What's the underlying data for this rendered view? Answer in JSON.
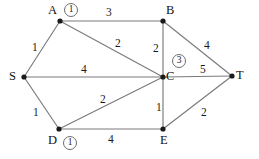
{
  "figure": {
    "type": "weighted-undirected-graph",
    "background_color": "#ffffff",
    "edge_color": "#7a7a7a",
    "node_color": "#1a1a1a",
    "annotation_border_color": "#6e6e6e"
  },
  "nodes": [
    {
      "id": "S",
      "label": "S",
      "x": 24,
      "y": 77,
      "label_x": 9,
      "label_y": 70,
      "annotation": null
    },
    {
      "id": "A",
      "label": "A",
      "x": 60,
      "y": 21,
      "label_x": 48,
      "label_y": 4,
      "annotation": "1"
    },
    {
      "id": "B",
      "label": "B",
      "x": 163,
      "y": 21,
      "label_x": 166,
      "label_y": 4,
      "annotation": null
    },
    {
      "id": "C",
      "label": "C",
      "x": 163,
      "y": 77,
      "label_x": 166,
      "label_y": 70,
      "annotation": "3"
    },
    {
      "id": "D",
      "label": "D",
      "x": 59,
      "y": 129,
      "label_x": 48,
      "label_y": 134,
      "annotation": "1"
    },
    {
      "id": "E",
      "label": "E",
      "x": 163,
      "y": 129,
      "label_x": 160,
      "label_y": 134,
      "annotation": null
    },
    {
      "id": "T",
      "label": "T",
      "x": 232,
      "y": 76,
      "label_x": 236,
      "label_y": 69,
      "annotation": null
    }
  ],
  "node_annotations": [
    {
      "node": "A",
      "value": "1",
      "x": 64,
      "y": 3
    },
    {
      "node": "C",
      "value": "3",
      "x": 172,
      "y": 54
    },
    {
      "node": "D",
      "value": "1",
      "x": 63,
      "y": 136
    }
  ],
  "edges": [
    {
      "id": "S-A",
      "from": "S",
      "to": "A",
      "weight": "1",
      "label_x": 32,
      "label_y": 42
    },
    {
      "id": "S-C",
      "from": "S",
      "to": "C",
      "weight": "4",
      "label_x": 81,
      "label_y": 64
    },
    {
      "id": "S-D",
      "from": "S",
      "to": "D",
      "weight": "1",
      "label_x": 33,
      "label_y": 107
    },
    {
      "id": "A-B",
      "from": "A",
      "to": "B",
      "weight": "3",
      "label_x": 106,
      "label_y": 7
    },
    {
      "id": "A-C",
      "from": "A",
      "to": "C",
      "weight": "2",
      "label_x": 115,
      "label_y": 38
    },
    {
      "id": "B-C",
      "from": "B",
      "to": "C",
      "weight": "2",
      "label_x": 153,
      "label_y": 43
    },
    {
      "id": "B-T",
      "from": "B",
      "to": "T",
      "weight": "4",
      "label_x": 204,
      "label_y": 40
    },
    {
      "id": "C-T",
      "from": "C",
      "to": "T",
      "weight": "5",
      "label_x": 200,
      "label_y": 64
    },
    {
      "id": "C-D",
      "from": "C",
      "to": "D",
      "weight": "2",
      "label_x": 100,
      "label_y": 94
    },
    {
      "id": "C-E",
      "from": "C",
      "to": "E",
      "weight": "1",
      "label_x": 156,
      "label_y": 102
    },
    {
      "id": "D-E",
      "from": "D",
      "to": "E",
      "weight": "4",
      "label_x": 108,
      "label_y": 134
    },
    {
      "id": "E-T",
      "from": "E",
      "to": "T",
      "weight": "2",
      "label_x": 201,
      "label_y": 107
    }
  ]
}
